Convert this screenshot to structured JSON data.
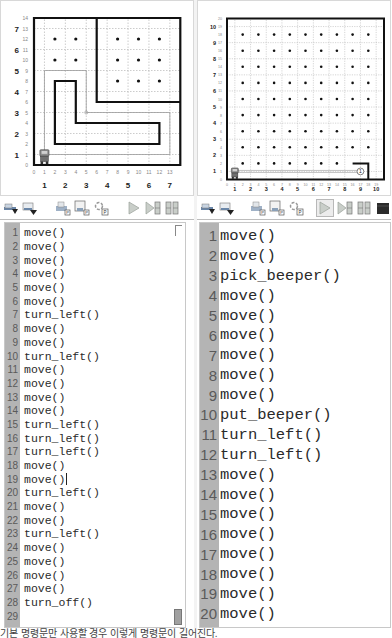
{
  "left": {
    "world": {
      "avenue_labels": [
        "1",
        "2",
        "3",
        "4",
        "5",
        "6",
        "7"
      ],
      "street_labels": [
        "1",
        "2",
        "3",
        "4",
        "5",
        "6",
        "7"
      ],
      "x_index_labels": [
        "0",
        "1",
        "2",
        "3",
        "4",
        "5",
        "6",
        "7",
        "8",
        "9",
        "10",
        "11",
        "12",
        "13"
      ],
      "y_index_labels": [
        "0",
        "1",
        "2",
        "3",
        "4",
        "5",
        "6",
        "7",
        "8",
        "9",
        "10",
        "11",
        "12",
        "13",
        "14"
      ],
      "robot_position": {
        "avenue": 1,
        "street": 1
      }
    },
    "code": {
      "line_numbers": [
        "1",
        "2",
        "3",
        "4",
        "5",
        "6",
        "7",
        "8",
        "9",
        "10",
        "11",
        "12",
        "13",
        "14",
        "15",
        "16",
        "17",
        "18",
        "19",
        "20",
        "21",
        "22",
        "23",
        "24",
        "25",
        "26",
        "27",
        "28",
        "29"
      ],
      "lines": [
        "move()",
        "move()",
        "move()",
        "move()",
        "move()",
        "move()",
        "turn_left()",
        "move()",
        "move()",
        "turn_left()",
        "move()",
        "move()",
        "move()",
        "move()",
        "turn_left()",
        "turn_left()",
        "turn_left()",
        "move()",
        "move()",
        "turn_left()",
        "move()",
        "move()",
        "turn_left()",
        "move()",
        "move()",
        "move()",
        "move()",
        "turn_off()",
        ""
      ],
      "cursor_line": 19
    }
  },
  "right": {
    "world": {
      "avenue_labels": [
        "1",
        "2",
        "3",
        "4",
        "5",
        "6",
        "7",
        "8",
        "9",
        "10"
      ],
      "street_labels": [
        "1",
        "2",
        "3",
        "4",
        "5",
        "6",
        "7",
        "8",
        "9",
        "10"
      ],
      "x_index_labels": [
        "0",
        "1",
        "2",
        "3",
        "4",
        "5",
        "6",
        "7",
        "8",
        "9",
        "10",
        "11",
        "12",
        "13",
        "14",
        "15",
        "16",
        "17",
        "18",
        "19"
      ],
      "y_index_labels": [
        "0",
        "1",
        "2",
        "3",
        "4",
        "5",
        "6",
        "7",
        "8",
        "9",
        "10",
        "11",
        "12",
        "13",
        "14",
        "15",
        "16",
        "17",
        "18",
        "19",
        "20"
      ],
      "robot_position": {
        "avenue": 1,
        "street": 1
      },
      "beeper_count": "1"
    },
    "code": {
      "line_numbers": [
        "1",
        "2",
        "3",
        "4",
        "5",
        "6",
        "7",
        "8",
        "9",
        "10",
        "11",
        "12",
        "13",
        "14",
        "15",
        "16",
        "17",
        "18",
        "19",
        "20",
        "21"
      ],
      "lines": [
        "move()",
        "move()",
        "pick_beeper()",
        "move()",
        "move()",
        "move()",
        "move()",
        "move()",
        "move()",
        "put_beeper()",
        "turn_left()",
        "turn_left()",
        "move()",
        "move()",
        "move()",
        "move()",
        "move()",
        "move()",
        "move()",
        "move()",
        "turn_off()"
      ]
    }
  },
  "toolbar": {
    "buttons": [
      {
        "name": "load-world-button",
        "icon": "load-world-icon"
      },
      {
        "name": "save-world-button",
        "icon": "save-world-icon"
      },
      {
        "name": "load-program-button",
        "icon": "load-program-icon"
      },
      {
        "name": "save-program-button",
        "icon": "save-program-icon"
      },
      {
        "name": "reload-program-button",
        "icon": "reload-icon"
      },
      {
        "name": "run-button",
        "icon": "play-icon"
      },
      {
        "name": "step-button",
        "icon": "step-icon"
      },
      {
        "name": "pause-button",
        "icon": "pause-icon"
      },
      {
        "name": "stop-button",
        "icon": "stop-icon"
      }
    ]
  },
  "caption": "기본 명령문만 사용할 경우 이렇게 명령문이 길어진다."
}
